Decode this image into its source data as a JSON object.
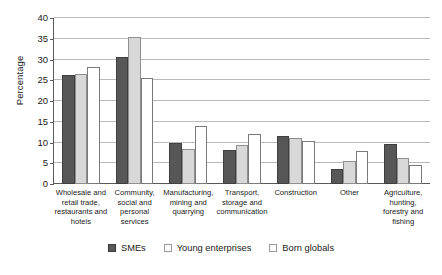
{
  "chart_data": {
    "type": "bar",
    "title": "",
    "xlabel": "",
    "ylabel": "Percentage",
    "ylim": [
      0,
      40
    ],
    "yticks": [
      0,
      5,
      10,
      15,
      20,
      25,
      30,
      35,
      40
    ],
    "grid": true,
    "legend_position": "bottom",
    "categories": [
      "Wholesale and retail trade, restaurants and hotels",
      "Community, social and personal services",
      "Manufacturing, mining and quarrying",
      "Transport, storage and communication",
      "Construction",
      "Other",
      "Agriculture, hunting, forestry and fishing"
    ],
    "series": [
      {
        "name": "SMEs",
        "color": "#575757",
        "values": [
          26.3,
          30.6,
          9.8,
          8.2,
          11.6,
          3.7,
          9.7
        ]
      },
      {
        "name": "Young enterprises",
        "color": "#d8d8d8",
        "values": [
          26.4,
          35.4,
          8.4,
          9.3,
          11.2,
          5.6,
          6.2
        ]
      },
      {
        "name": "Born globals",
        "color": "#ffffff",
        "values": [
          28.2,
          25.5,
          14.1,
          12.0,
          10.3,
          8.0,
          4.5
        ]
      }
    ]
  },
  "axis": {
    "y_title": "Percentage",
    "tick_labels": [
      "40",
      "35",
      "30",
      "25",
      "20",
      "15",
      "10",
      "5",
      "0"
    ]
  },
  "category_labels": [
    [
      "Wholesale and",
      "retail trade,",
      "restaurants and",
      "hotels"
    ],
    [
      "Community,",
      "social and",
      "personal",
      "services"
    ],
    [
      "Manufacturing,",
      "mining and",
      "quarrying"
    ],
    [
      "Transport,",
      "storage and",
      "communication"
    ],
    [
      "Construction"
    ],
    [
      "Other"
    ],
    [
      "Agriculture,",
      "hunting,",
      "forestry and",
      "fishing"
    ]
  ],
  "legend": {
    "items": [
      {
        "label": "SMEs",
        "swatch": "filled-dark-square"
      },
      {
        "label": "Young enterprises",
        "swatch": "light-square"
      },
      {
        "label": "Born globals",
        "swatch": "empty-square"
      }
    ]
  },
  "caption": ""
}
